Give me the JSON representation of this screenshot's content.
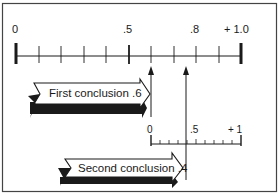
{
  "diagram": {
    "main_scale": {
      "labels": {
        "start": "0",
        "mid": ".5",
        "p8": ".8",
        "end": "+ 1.0"
      },
      "min": 0,
      "max": 1.0,
      "tick_step": 0.1
    },
    "sub_scale": {
      "labels": {
        "start": "0",
        "mid": ".5",
        "end": "+ 1"
      },
      "min": 0,
      "max": 1,
      "tick_step": 0.1,
      "spans_main_from": 0.6,
      "spans_main_to": 1.0
    },
    "conclusions": [
      {
        "label": "First conclusion .6",
        "value": 0.6
      },
      {
        "label": "Second conclusion .4",
        "value": 0.4
      }
    ],
    "markers": [
      {
        "name": "first-conclusion-marker",
        "main_value": 0.6
      },
      {
        "name": "combined-marker",
        "main_value": 0.76
      }
    ],
    "colors": {
      "ink": "#1a1a1a",
      "frame": "#444444",
      "background": "#ffffff"
    }
  }
}
